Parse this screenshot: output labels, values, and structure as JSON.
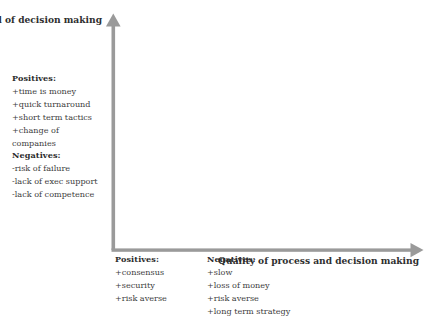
{
  "diagram": {
    "title_y": "Speed of\ndecision\nmaking",
    "y_axis_label_lines": [
      "Speed of",
      "decision",
      "making"
    ],
    "x_axis_label_lines": [
      "Quality of process and",
      "decision making"
    ],
    "axis_color": "#999999",
    "text_color": "#3d3d3d",
    "background_color": "#ffffff"
  },
  "quadrant_upper_left": {
    "positives_heading": "Positives:",
    "positives": [
      "+time is money",
      "+quick turnaround",
      "+short term tactics",
      "+change of",
      "companies"
    ],
    "negatives_heading": "Negatives:",
    "negatives": [
      "-risk of failure",
      "-lack of exec support",
      "-lack of competence"
    ]
  },
  "quadrant_bottom_left": {
    "positives_heading": "Positives:",
    "positives": [
      "+consensus",
      "+security",
      "+risk averse"
    ]
  },
  "quadrant_bottom_right": {
    "negatives_heading": "Negatives:",
    "negatives": [
      "+slow",
      "+loss of money",
      "+risk averse",
      "+long term strategy"
    ]
  }
}
